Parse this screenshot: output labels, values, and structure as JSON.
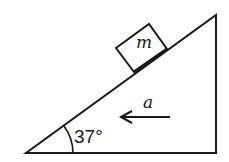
{
  "diagram": {
    "type": "inclined-plane",
    "block": {
      "label": "m"
    },
    "acceleration": {
      "label": "a",
      "direction": "left"
    },
    "angle": {
      "label": "37°"
    },
    "colors": {
      "stroke": "#1a1a1a",
      "background": "#ffffff"
    }
  }
}
